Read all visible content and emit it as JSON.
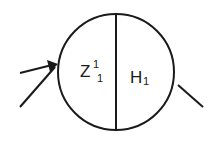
{
  "diagram": {
    "node": {
      "shape": "circle",
      "divided": "vertical",
      "left_label": {
        "base": "Z",
        "superscript": "1",
        "subscript": "1"
      },
      "right_label": {
        "base": "H",
        "subscript": "1"
      }
    },
    "incoming_arcs": 2,
    "outgoing_arcs": 1,
    "colors": {
      "stroke": "#1a1a1a",
      "background": "#ffffff"
    }
  }
}
